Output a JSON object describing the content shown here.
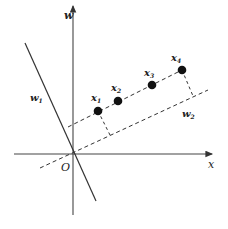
{
  "diagram": {
    "axes": {
      "x_label": "x",
      "y_label": "w",
      "origin_label": "O"
    },
    "lines": {
      "w1_label": "w",
      "w1_sub": "1",
      "w2_label": "w",
      "w2_sub": "2"
    },
    "points": [
      {
        "label": "x",
        "sub": "1"
      },
      {
        "label": "x",
        "sub": "2"
      },
      {
        "label": "x",
        "sub": "3"
      },
      {
        "label": "x",
        "sub": "4"
      }
    ],
    "colors": {
      "ink": "#222222",
      "background": "#ffffff"
    }
  }
}
